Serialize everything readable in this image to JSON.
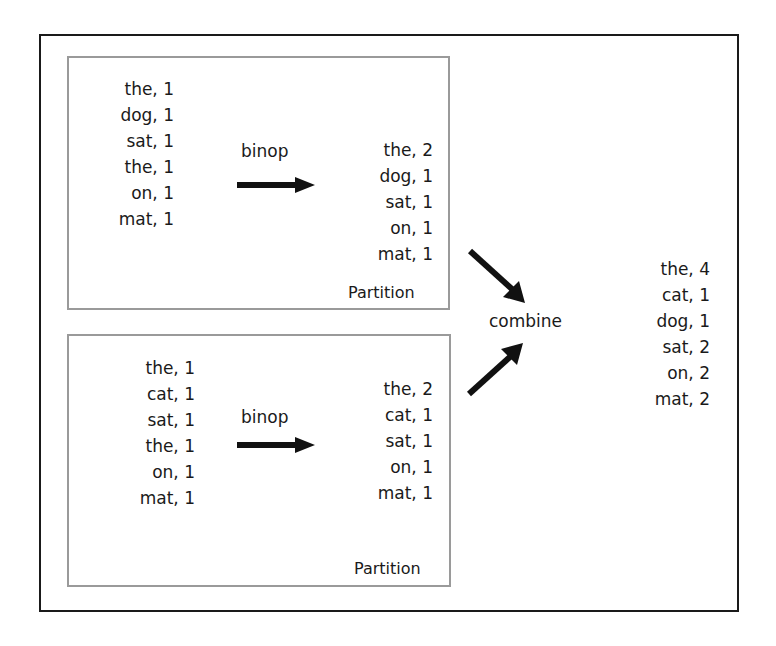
{
  "diagram": {
    "partitions": [
      {
        "label": "Partition",
        "input": [
          "the, 1",
          "dog, 1",
          "sat, 1",
          "the, 1",
          "on, 1",
          "mat, 1"
        ],
        "operation": "binop",
        "output": [
          "the, 2",
          "dog, 1",
          "sat, 1",
          "on, 1",
          "mat, 1"
        ]
      },
      {
        "label": "Partition",
        "input": [
          "the, 1",
          "cat, 1",
          "sat, 1",
          "the, 1",
          "on, 1",
          "mat, 1"
        ],
        "operation": "binop",
        "output": [
          "the, 2",
          "cat, 1",
          "sat, 1",
          "on, 1",
          "mat, 1"
        ]
      }
    ],
    "combine_label": "combine",
    "result": [
      "the, 4",
      "cat, 1",
      "dog, 1",
      "sat, 2",
      "on, 2",
      "mat, 2"
    ],
    "colors": {
      "border": "#1a1a1a",
      "partition_border": "#9a9a9a",
      "text": "#1a1a1a"
    }
  }
}
